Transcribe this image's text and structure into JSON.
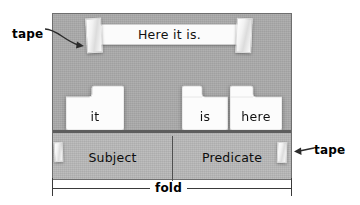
{
  "diagram": {
    "title_strip_text": "Here it is.",
    "cards": [
      {
        "id": "it",
        "label": "it"
      },
      {
        "id": "is",
        "label": "is"
      },
      {
        "id": "here",
        "label": "here"
      }
    ],
    "flap": {
      "subject_label": "Subject",
      "predicate_label": "Predicate"
    },
    "callouts": {
      "tape_left": "tape",
      "tape_right": "tape"
    },
    "fold": {
      "label": "fold"
    },
    "colors": {
      "board_gray": "#a9a9a9",
      "flap_gray": "#b6b6b6",
      "board_border": "#6e6e6e",
      "fold_shadow": "#5d5d5d",
      "card_white": "#fbfbfb",
      "text_black": "#111111",
      "page_background": "#ffffff"
    }
  }
}
